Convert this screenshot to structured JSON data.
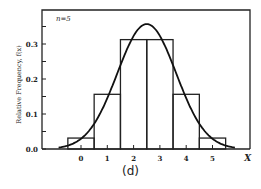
{
  "chart_data": {
    "type": "bar",
    "title": "",
    "annotation": "n=5",
    "xlabel": "X",
    "ylabel": "Relative Frequency, f(x)",
    "categories": [
      "0",
      "1",
      "2",
      "3",
      "4",
      "5"
    ],
    "x": [
      0,
      1,
      2,
      3,
      4,
      5
    ],
    "values": [
      0.03125,
      0.15625,
      0.3125,
      0.3125,
      0.15625,
      0.03125
    ],
    "series": [
      {
        "name": "Binomial histogram (n=5)",
        "type": "bar",
        "values": [
          0.03125,
          0.15625,
          0.3125,
          0.3125,
          0.15625,
          0.03125
        ]
      },
      {
        "name": "Normal approximation curve",
        "type": "line",
        "mean": 2.5,
        "sd": 1.118,
        "peak": 0.357
      }
    ],
    "yticks": [
      "0.0",
      "0.1",
      "0.2",
      "0.3"
    ],
    "ylim": [
      0,
      0.4
    ],
    "xlim": [
      -1.5,
      6.5
    ],
    "grid": false,
    "legend": "none",
    "caption": "(d)"
  }
}
